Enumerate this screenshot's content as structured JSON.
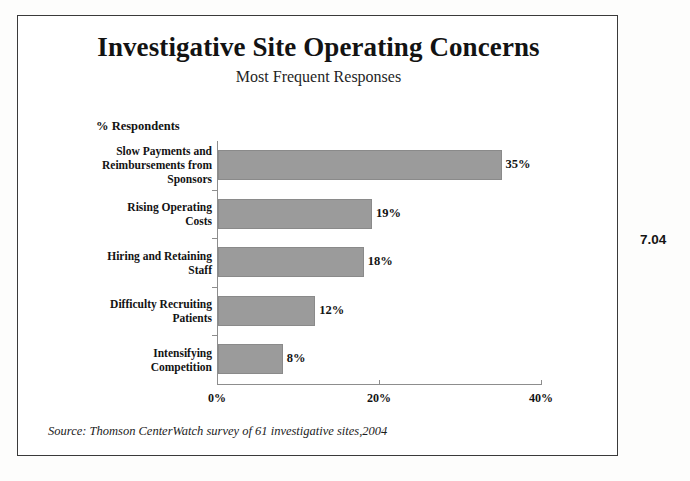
{
  "figure": {
    "number": "7.04",
    "source_note": "Source:  Thomson CenterWatch survey of  61 investigative sites,2004"
  },
  "chart_data": {
    "type": "bar",
    "orientation": "horizontal",
    "title": "Investigative Site Operating Concerns",
    "subtitle": "Most Frequent Responses",
    "xlabel": "",
    "ylabel": "% Respondents",
    "categories": [
      "Slow Payments and Reimbursements from Sponsors",
      "Rising Operating Costs",
      "Hiring and Retaining Staff",
      "Difficulty Recruiting Patients",
      "Intensifying Competition"
    ],
    "category_lines": [
      [
        "Slow Payments and",
        "Reimbursements from",
        "Sponsors"
      ],
      [
        "Rising Operating",
        "Costs"
      ],
      [
        "Hiring and Retaining",
        "Staff"
      ],
      [
        "Difficulty Recruiting",
        "Patients"
      ],
      [
        "Intensifying",
        "Competition"
      ]
    ],
    "values": [
      35,
      19,
      18,
      12,
      8
    ],
    "data_labels": [
      "35%",
      "19%",
      "18%",
      "12%",
      "8%"
    ],
    "xlim": [
      0,
      40
    ],
    "xticks": [
      0,
      20,
      40
    ],
    "xtick_labels": [
      "0%",
      "20%",
      "40%"
    ],
    "grid": false,
    "legend": false,
    "bar_color": "#9b9b9b",
    "bar_edge_color": "#8a8a8a",
    "axis_color": "#8d8d8d",
    "frame_color": "#3a3a3a",
    "background": "#ffffff"
  }
}
